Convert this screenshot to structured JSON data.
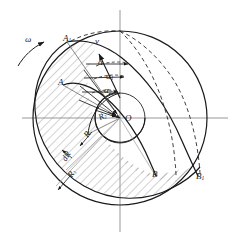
{
  "figure": {
    "type": "engineering-diagram",
    "canvas": {
      "width": 241,
      "height": 240
    },
    "center": {
      "label": "O",
      "x": 120,
      "y": 118
    },
    "colors": {
      "ink": "#1a1a1a",
      "axis": "#808080",
      "hatch": "#707070",
      "dashed": "#2a2a2a",
      "background": "#ffffff"
    },
    "circles": [
      {
        "name": "outer-circle",
        "cx": 120,
        "cy": 118,
        "r": 87,
        "style": "solid"
      },
      {
        "name": "vane-outer-circle",
        "cx": 97,
        "cy": 128,
        "r": 64,
        "style": "solid"
      },
      {
        "name": "inner-hub-circle",
        "cx": 120,
        "cy": 118,
        "r": 25,
        "style": "solid"
      }
    ],
    "axes": {
      "horizontal": {
        "y": 118,
        "x1": 22,
        "x2": 228,
        "style": "center-line"
      },
      "vertical": {
        "x": 120,
        "y1": 10,
        "y2": 232,
        "style": "center-line"
      }
    },
    "points": [
      {
        "name": "point-A1",
        "label": "A",
        "sub": "1",
        "x": 67,
        "y": 42
      },
      {
        "name": "point-A",
        "label": "A",
        "sub": "",
        "x": 63,
        "y": 85
      },
      {
        "name": "point-B",
        "label": "B",
        "sub": "",
        "x": 155,
        "y": 175
      },
      {
        "name": "point-B1",
        "label": "B",
        "sub": "1",
        "x": 198,
        "y": 176
      },
      {
        "name": "point-O",
        "label": "O",
        "sub": "",
        "x": 126,
        "y": 121
      }
    ],
    "angles": [
      {
        "name": "angle-alpha",
        "label": "α",
        "sub": "",
        "x": 100,
        "y": 71
      },
      {
        "name": "angle-alpha1",
        "label": "α",
        "sub": "1",
        "x": 109,
        "y": 84
      },
      {
        "name": "angle-alpha2",
        "label": "α",
        "sub": "2",
        "x": 107,
        "y": 97
      }
    ],
    "radii": [
      {
        "name": "radius-R2",
        "label": "R",
        "sub": "2",
        "x": 100,
        "y": 120,
        "rotate": -28
      },
      {
        "name": "radius-R",
        "label": "R",
        "sub": "",
        "x": 84,
        "y": 140,
        "rotate": -55
      },
      {
        "name": "radius-dR",
        "label": "dR",
        "sub": "",
        "x": 67,
        "y": 162,
        "rotate": -60
      },
      {
        "name": "radius-R1",
        "label": "R",
        "sub": "1",
        "x": 74,
        "y": 178,
        "rotate": -55
      }
    ],
    "vectors": [
      {
        "name": "velocity-vector-v",
        "label": "v",
        "sub": "",
        "x": 97,
        "y": 44
      },
      {
        "name": "angular-velocity-omega",
        "label": "ω",
        "sub": "",
        "x": 28,
        "y": 41
      }
    ],
    "curve_notes": {
      "spiral_vane_leading": "A1 to B1 logarithmic spiral, solid",
      "spiral_vane_trailing": "A to B logarithmic spiral, solid",
      "dashed_guides": "two dashed spiral arcs from top of outer circle to B and B1",
      "hatched_region": "annular vane channel between the two spirals, 45-degree hatch"
    }
  }
}
